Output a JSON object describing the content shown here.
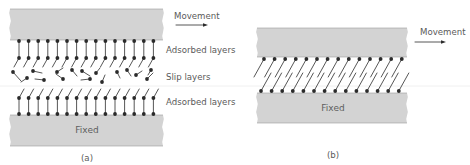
{
  "colors": {
    "block_fill": "#d3d3d3",
    "block_edge": "#9a9a9a",
    "molecule": "#2b2b2b",
    "text": "#5a5a5a",
    "scan_line": "#e6e6e6"
  },
  "panel_a": {
    "caption": "(a)",
    "movement_label": "Movement",
    "top_block_label": "",
    "bottom_block_label": "Fixed",
    "layer_labels": [
      "Adsorbed layers",
      "Slip layers",
      "Adsorbed layers"
    ],
    "top_block": {
      "x": 10,
      "y": 9,
      "w": 153,
      "h": 31
    },
    "bottom_block": {
      "x": 10,
      "y": 115,
      "w": 153,
      "h": 31
    },
    "adsorbed_molecules_per_layer": 15,
    "molecule_spacing": 9.6,
    "first_molecule_x": 19
  },
  "panel_b": {
    "caption": "(b)",
    "movement_label": "Movement",
    "bottom_block_label": "Fixed",
    "top_block": {
      "x": 257,
      "y": 28,
      "w": 150,
      "h": 29
    },
    "bottom_block": {
      "x": 257,
      "y": 93,
      "w": 150,
      "h": 30
    },
    "molecules_per_layer": 14,
    "molecule_spacing": 10.6
  }
}
